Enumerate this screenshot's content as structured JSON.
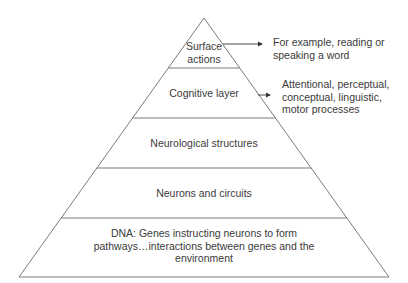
{
  "diagram": {
    "type": "pyramid",
    "line_color": "#7a7a7a",
    "text_color": "#3a3a3a",
    "layers": [
      {
        "id": "surface-actions",
        "label": "Surface actions",
        "lines": [
          "Surface",
          "actions"
        ]
      },
      {
        "id": "cognitive-layer",
        "label": "Cognitive layer",
        "lines": [
          "Cognitive layer"
        ]
      },
      {
        "id": "neurological-structures",
        "label": "Neurological structures",
        "lines": [
          "Neurological structures"
        ]
      },
      {
        "id": "neurons-and-circuits",
        "label": "Neurons and circuits",
        "lines": [
          "Neurons and circuits"
        ]
      },
      {
        "id": "dna",
        "label": "DNA: Genes instructing neurons to form pathways…interactions between genes and the environment",
        "lines": [
          "DNA: Genes instructing neurons to form",
          "pathways…interactions between genes and the",
          "environment"
        ]
      }
    ],
    "annotations": [
      {
        "target": "surface-actions",
        "lines": [
          "For example, reading or",
          "speaking a word"
        ]
      },
      {
        "target": "cognitive-layer",
        "lines": [
          "Attentional, perceptual,",
          "conceptual, linguistic,",
          "motor processes"
        ]
      }
    ]
  }
}
